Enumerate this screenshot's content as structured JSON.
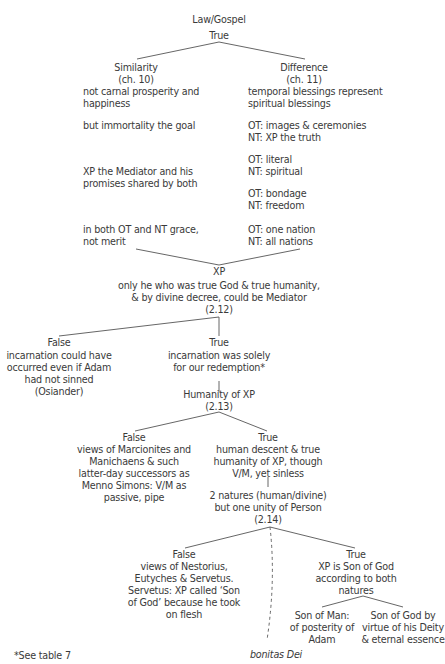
{
  "root": {
    "cut_header": "…",
    "title": "Law/Gospel",
    "verdict": "True"
  },
  "similarity": {
    "heading": "Similarity",
    "chapter": "(ch. 10)",
    "items": [
      [
        "not carnal prosperity and",
        "happiness"
      ],
      [
        "but immortality the goal"
      ],
      [
        "XP the Mediator and his",
        "promises shared by both"
      ],
      [
        "in both OT and NT grace,",
        "not merit"
      ]
    ]
  },
  "difference": {
    "heading": "Difference",
    "chapter": "(ch. 11)",
    "items": [
      [
        "temporal blessings represent",
        "spiritual blessings"
      ],
      [
        "OT: images & ceremonies",
        "NT: XP the truth"
      ],
      [
        "OT: literal",
        "NT: spiritual"
      ],
      [
        "OT: bondage",
        "NT: freedom"
      ],
      [
        "OT: one nation",
        "NT: all nations"
      ]
    ]
  },
  "xp": {
    "label": "XP",
    "lines": [
      "only he who was true God & true humanity,",
      "& by divine decree, could be Mediator",
      "(2.12)"
    ]
  },
  "incarnation": {
    "false_label": "False",
    "false_lines": [
      "incarnation could have",
      "occurred even if Adam",
      "had not sinned",
      "(Osiander)"
    ],
    "true_label": "True",
    "true_lines": [
      "incarnation was solely",
      "for our redemption*"
    ]
  },
  "humanity": {
    "lines": [
      "Humanity of XP",
      "(2.13)"
    ],
    "false_label": "False",
    "false_lines": [
      "views of Marcionites and",
      "Manichaens & such",
      "latter-day successors as",
      "Menno Simons: V/M as",
      "passive, pipe"
    ],
    "true_label": "True",
    "true_lines": [
      "human descent & true",
      "humanity of XP, though",
      "V/M, yet sinless"
    ]
  },
  "natures": {
    "lines": [
      "2 natures (human/divine)",
      "but one unity of Person",
      "(2.14)"
    ],
    "false_label": "False",
    "false_lines": [
      "views of Nestorius,",
      "Eutyches & Servetus.",
      "Servetus: XP called ‘Son",
      "of God’ because he took",
      "on flesh"
    ],
    "true_label": "True",
    "true_lines": [
      "XP is Son of God",
      "according to both",
      "natures"
    ],
    "son_of_man": [
      "Son of Man:",
      "of posterity of",
      "Adam"
    ],
    "son_of_god": [
      "Son of God by",
      "virtue of his Deity",
      "& eternal essence"
    ]
  },
  "bonitas": "bonitas Dei",
  "footnote": "*See table 7",
  "colors": {
    "text": "#3a3a3a",
    "line": "#555555"
  }
}
